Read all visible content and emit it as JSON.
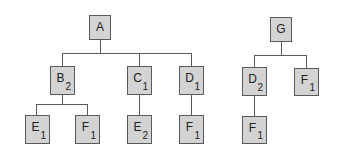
{
  "diagram": {
    "type": "tree-forest",
    "colors": {
      "node_fill": "#d3d3d3",
      "node_border": "#5a5a5a",
      "edge": "#5a5a5a",
      "text": "#222222"
    },
    "trees": [
      {
        "root": "A",
        "nodes": [
          {
            "id": "A",
            "label": "A",
            "sub": "",
            "x": 89,
            "y": 15,
            "w": 22,
            "h": 25
          },
          {
            "id": "B",
            "label": "B",
            "sub": "2",
            "x": 50,
            "y": 66,
            "w": 25,
            "h": 29
          },
          {
            "id": "C",
            "label": "C",
            "sub": "1",
            "x": 127,
            "y": 66,
            "w": 25,
            "h": 29
          },
          {
            "id": "D",
            "label": "D",
            "sub": "1",
            "x": 179,
            "y": 66,
            "w": 25,
            "h": 29
          },
          {
            "id": "E1",
            "label": "E",
            "sub": "1",
            "x": 25,
            "y": 115,
            "w": 25,
            "h": 29
          },
          {
            "id": "F1",
            "label": "F",
            "sub": "1",
            "x": 75,
            "y": 115,
            "w": 25,
            "h": 29
          },
          {
            "id": "E2",
            "label": "E",
            "sub": "2",
            "x": 127,
            "y": 115,
            "w": 25,
            "h": 29
          },
          {
            "id": "F2",
            "label": "F",
            "sub": "1",
            "x": 179,
            "y": 115,
            "w": 25,
            "h": 29
          }
        ],
        "edges": [
          [
            "A",
            "B"
          ],
          [
            "A",
            "C"
          ],
          [
            "A",
            "D"
          ],
          [
            "B",
            "E1"
          ],
          [
            "B",
            "F1"
          ],
          [
            "C",
            "E2"
          ],
          [
            "D",
            "F2"
          ]
        ]
      },
      {
        "root": "G",
        "nodes": [
          {
            "id": "G",
            "label": "G",
            "sub": "",
            "x": 270,
            "y": 17,
            "w": 22,
            "h": 25
          },
          {
            "id": "D3",
            "label": "D",
            "sub": "2",
            "x": 242,
            "y": 67,
            "w": 25,
            "h": 29
          },
          {
            "id": "F3",
            "label": "F",
            "sub": "1",
            "x": 294,
            "y": 68,
            "w": 25,
            "h": 28
          },
          {
            "id": "F4",
            "label": "F",
            "sub": "1",
            "x": 242,
            "y": 116,
            "w": 25,
            "h": 28
          }
        ],
        "edges": [
          [
            "G",
            "D3"
          ],
          [
            "G",
            "F3"
          ],
          [
            "D3",
            "F4"
          ]
        ]
      }
    ],
    "edge_segments": [
      {
        "x": 100,
        "y": 40,
        "w": 1,
        "h": 13
      },
      {
        "x": 62,
        "y": 53,
        "w": 130,
        "h": 1
      },
      {
        "x": 62,
        "y": 53,
        "w": 1,
        "h": 13
      },
      {
        "x": 139,
        "y": 53,
        "w": 1,
        "h": 13
      },
      {
        "x": 191,
        "y": 53,
        "w": 1,
        "h": 13
      },
      {
        "x": 62,
        "y": 95,
        "w": 1,
        "h": 9
      },
      {
        "x": 36,
        "y": 104,
        "w": 52,
        "h": 1
      },
      {
        "x": 36,
        "y": 104,
        "w": 1,
        "h": 11
      },
      {
        "x": 87,
        "y": 104,
        "w": 1,
        "h": 11
      },
      {
        "x": 139,
        "y": 95,
        "w": 1,
        "h": 20
      },
      {
        "x": 191,
        "y": 95,
        "w": 1,
        "h": 20
      },
      {
        "x": 281,
        "y": 42,
        "w": 1,
        "h": 13
      },
      {
        "x": 254,
        "y": 55,
        "w": 53,
        "h": 1
      },
      {
        "x": 254,
        "y": 55,
        "w": 1,
        "h": 12
      },
      {
        "x": 306,
        "y": 55,
        "w": 1,
        "h": 13
      },
      {
        "x": 254,
        "y": 96,
        "w": 1,
        "h": 20
      }
    ]
  }
}
